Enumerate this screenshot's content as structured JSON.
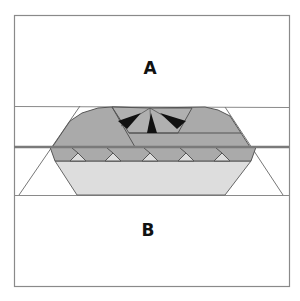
{
  "diagram": {
    "labels": {
      "top": "A",
      "bottom": "B"
    },
    "colors": {
      "background": "#ffffff",
      "frame": "#8a8a8a",
      "thick_line": "#7a7a7a",
      "dark_gray": "#aaaaaa",
      "light_gray": "#dddddd",
      "black": "#111111",
      "edge": "#555555"
    }
  }
}
